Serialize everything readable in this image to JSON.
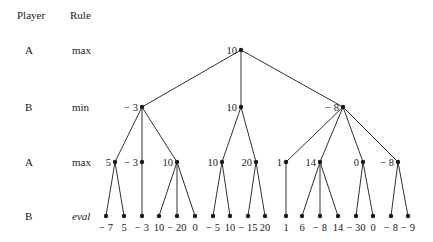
{
  "header": {
    "player_label": "Player",
    "rule_label": "Rule"
  },
  "levels": [
    {
      "player": "A",
      "rule": "max",
      "italic": false,
      "y": 50
    },
    {
      "player": "B",
      "rule": "min",
      "italic": false,
      "y": 107
    },
    {
      "player": "A",
      "rule": "max",
      "italic": false,
      "y": 162
    },
    {
      "player": "B",
      "rule": "eval",
      "italic": true,
      "y": 216
    }
  ],
  "tree": {
    "root": {
      "value": "10",
      "x": 241,
      "y": 50
    },
    "level1": [
      {
        "value": "− 3",
        "x": 142,
        "y": 107,
        "parent": "root"
      },
      {
        "value": "10",
        "x": 241,
        "y": 107,
        "parent": "root"
      },
      {
        "value": "− 8",
        "x": 343,
        "y": 107,
        "parent": "root"
      }
    ],
    "level2": [
      {
        "value": "5",
        "x": 115,
        "y": 162,
        "parent": 0
      },
      {
        "value": "− 3",
        "x": 142,
        "y": 162,
        "parent": 0
      },
      {
        "value": "10",
        "x": 177,
        "y": 162,
        "parent": 0
      },
      {
        "value": "10",
        "x": 222,
        "y": 162,
        "parent": 1
      },
      {
        "value": "20",
        "x": 256,
        "y": 162,
        "parent": 1
      },
      {
        "value": "1",
        "x": 286,
        "y": 162,
        "parent": 2
      },
      {
        "value": "14",
        "x": 320,
        "y": 162,
        "parent": 2
      },
      {
        "value": "0",
        "x": 363,
        "y": 162,
        "parent": 2
      },
      {
        "value": "− 8",
        "x": 398,
        "y": 162,
        "parent": 2
      }
    ],
    "leaves": [
      {
        "value": "− 7",
        "x": 106,
        "y": 216,
        "parent": 0
      },
      {
        "value": "5",
        "x": 124,
        "y": 216,
        "parent": 0
      },
      {
        "value": "− 3",
        "x": 142,
        "y": 216,
        "parent": 1
      },
      {
        "value": "10",
        "x": 159,
        "y": 216,
        "parent": 2
      },
      {
        "value": "− 20",
        "x": 177,
        "y": 216,
        "parent": 2
      },
      {
        "value": "0",
        "x": 195,
        "y": 216,
        "parent": 2
      },
      {
        "value": "− 5",
        "x": 213,
        "y": 216,
        "parent": 3
      },
      {
        "value": "10",
        "x": 230,
        "y": 216,
        "parent": 3
      },
      {
        "value": "− 15",
        "x": 248,
        "y": 216,
        "parent": 4
      },
      {
        "value": "20",
        "x": 265,
        "y": 216,
        "parent": 4
      },
      {
        "value": "1",
        "x": 286,
        "y": 216,
        "parent": 5
      },
      {
        "value": "6",
        "x": 302,
        "y": 216,
        "parent": 6
      },
      {
        "value": "− 8",
        "x": 320,
        "y": 216,
        "parent": 6
      },
      {
        "value": "14",
        "x": 338,
        "y": 216,
        "parent": 6
      },
      {
        "value": "− 30",
        "x": 356,
        "y": 216,
        "parent": 7
      },
      {
        "value": "0",
        "x": 373,
        "y": 216,
        "parent": 7
      },
      {
        "value": "− 8",
        "x": 391,
        "y": 216,
        "parent": 8
      },
      {
        "value": "− 9",
        "x": 408,
        "y": 216,
        "parent": 8
      }
    ]
  },
  "colors": {
    "ink": "#1a1a1a",
    "background": "#ffffff"
  }
}
